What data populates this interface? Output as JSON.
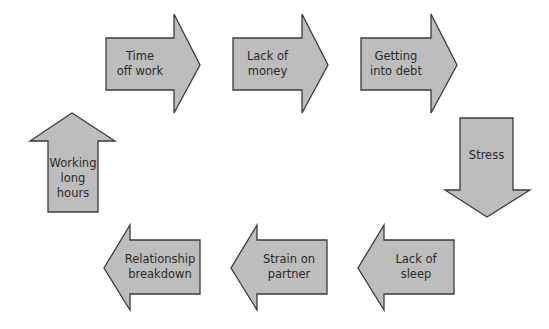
{
  "diagram": {
    "type": "cycle",
    "fill_color": "#bdbdbd",
    "stroke_color": "#3a3a3a",
    "nodes": [
      {
        "id": "time-off-work",
        "label": "Time\noff work",
        "direction": "right"
      },
      {
        "id": "lack-of-money",
        "label": "Lack of\nmoney",
        "direction": "right"
      },
      {
        "id": "getting-into-debt",
        "label": "Getting\ninto debt",
        "direction": "right"
      },
      {
        "id": "stress",
        "label": "Stress",
        "direction": "down"
      },
      {
        "id": "lack-of-sleep",
        "label": "Lack of\nsleep",
        "direction": "left"
      },
      {
        "id": "strain-on-partner",
        "label": "Strain on\npartner",
        "direction": "left"
      },
      {
        "id": "relationship-breakdown",
        "label": "Relationship\nbreakdown",
        "direction": "left"
      },
      {
        "id": "working-long-hours",
        "label": "Working\nlong\nhours",
        "direction": "up"
      }
    ],
    "edges": [
      [
        "working-long-hours",
        "time-off-work"
      ],
      [
        "time-off-work",
        "lack-of-money"
      ],
      [
        "lack-of-money",
        "getting-into-debt"
      ],
      [
        "getting-into-debt",
        "stress"
      ],
      [
        "stress",
        "lack-of-sleep"
      ],
      [
        "lack-of-sleep",
        "strain-on-partner"
      ],
      [
        "strain-on-partner",
        "relationship-breakdown"
      ],
      [
        "relationship-breakdown",
        "working-long-hours"
      ]
    ]
  }
}
